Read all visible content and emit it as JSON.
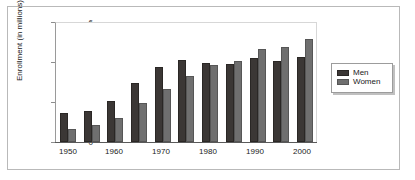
{
  "chart_data": {
    "type": "bar",
    "title": "",
    "xlabel": "",
    "ylabel": "Enrollment (in millions)",
    "ylim": [
      0,
      6
    ],
    "yticks": [
      "0",
      "2",
      "4",
      "6"
    ],
    "grid": false,
    "legend_position": "right",
    "categories": [
      "1950",
      "1955",
      "1960",
      "1965",
      "1970",
      "1975",
      "1980",
      "1985",
      "1990",
      "1995",
      "2000"
    ],
    "tick_labels": [
      "1950",
      "1960",
      "1970",
      "1980",
      "1990",
      "2000"
    ],
    "series": [
      {
        "name": "Men",
        "color": "#3b3735",
        "values": [
          1.45,
          1.55,
          2.05,
          2.95,
          3.75,
          4.1,
          3.95,
          3.9,
          4.2,
          4.05,
          4.25
        ]
      },
      {
        "name": "Women",
        "color": "#6f6f6f",
        "values": [
          0.65,
          0.85,
          1.2,
          1.95,
          2.65,
          3.3,
          3.85,
          4.05,
          4.65,
          4.75,
          5.15
        ]
      }
    ]
  },
  "legend": {
    "items": [
      {
        "label": "Men"
      },
      {
        "label": "Women"
      }
    ]
  }
}
